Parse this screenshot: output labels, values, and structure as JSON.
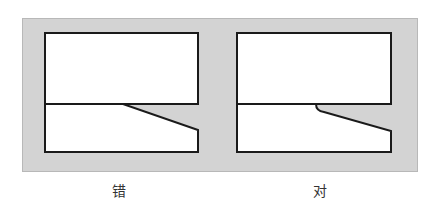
{
  "diagram": {
    "background_color": "#d3d3d3",
    "line_color": "#1a1a1a",
    "panels": [
      {
        "id": "wrong",
        "caption": "错",
        "top_rect": {
          "x": 45,
          "y": 33,
          "w": 153,
          "h": 71
        },
        "bottom_shape_points": "45,104 123,104 198,130 198,152 45,152",
        "joint": "sharp"
      },
      {
        "id": "right",
        "caption": "对",
        "top_rect": {
          "x": 237,
          "y": 33,
          "w": 154,
          "h": 71
        },
        "bottom_shape_path": "M237,104 L316,104 Q316,111 324,112 L391,131 L391,152 L237,152 Z",
        "joint": "rounded"
      }
    ]
  }
}
